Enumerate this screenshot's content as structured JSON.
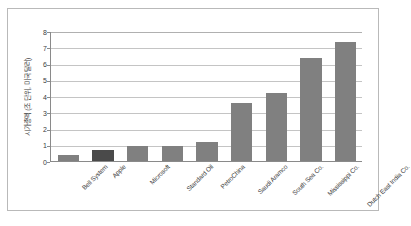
{
  "chart_data": {
    "type": "bar",
    "title": "",
    "subtitle": "",
    "xlabel": "",
    "ylabel": "시가총액 (조 단위, 미국 달러)",
    "ylim": [
      0,
      8
    ],
    "ytick_step": 1,
    "yticks": [
      "8",
      "7",
      "6",
      "5",
      "4",
      "3",
      "2",
      "1",
      "0"
    ],
    "grid": true,
    "legend": "none",
    "categories": [
      "Bell System",
      "Apple",
      "Microsoft",
      "Standard Oil",
      "PetroChina",
      "Saudi Aramco",
      "South Sea Co.",
      "Mississippi Co.",
      "Dutch East India Co."
    ],
    "values": [
      0.35,
      0.65,
      0.9,
      0.95,
      1.15,
      3.6,
      4.2,
      6.35,
      7.3
    ],
    "bar_colors": [
      "#808080",
      "#4a4a4a",
      "#808080",
      "#808080",
      "#808080",
      "#808080",
      "#808080",
      "#808080",
      "#808080"
    ],
    "highlight_index": 1,
    "accent_color": "#4a4a4a",
    "series_color": "#808080",
    "axis_color": "#8a8a8a",
    "grid_color": "#c4c4c4",
    "text_color": "#3b3b3b",
    "background": "#ffffff"
  }
}
